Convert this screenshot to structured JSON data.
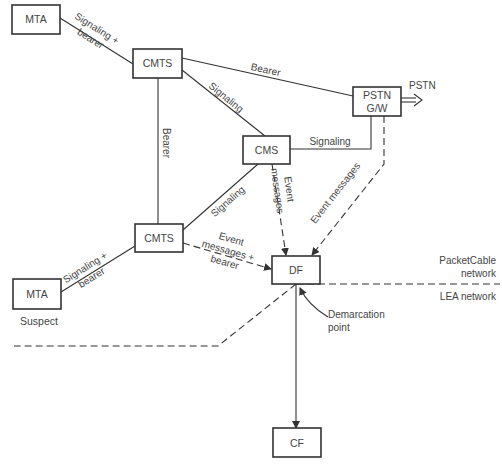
{
  "nodes": {
    "mta_top": {
      "label": "MTA"
    },
    "cmts_top": {
      "label": "CMTS"
    },
    "cms": {
      "label": "CMS"
    },
    "pstn_gw": {
      "label_line1": "PSTN",
      "label_line2": "G/W"
    },
    "cmts_bottom": {
      "label": "CMTS"
    },
    "mta_bottom": {
      "label": "MTA",
      "caption": "Suspect"
    },
    "df": {
      "label": "DF"
    },
    "cf": {
      "label": "CF"
    }
  },
  "edges": {
    "mta_top_cmts": {
      "line1": "Signaling +",
      "line2": "bearer"
    },
    "cmts_pstn": {
      "label": "Bearer"
    },
    "cmts_cms": {
      "label": "Signaling"
    },
    "cmts_cmts": {
      "label": "Bearer"
    },
    "cms_pstn": {
      "label": "Signaling"
    },
    "cms_cmts": {
      "label": "Signaling"
    },
    "cms_df": {
      "line1": "Event",
      "line2": "messages"
    },
    "pstn_df": {
      "label": "Event messages"
    },
    "cmts_df": {
      "line1": "Event",
      "line2": "messages +",
      "line3": "bearer"
    },
    "mta_bottom_cmts": {
      "line1": "Signaling +",
      "line2": "bearer"
    },
    "pstn_out": {
      "label": "PSTN"
    }
  },
  "regions": {
    "packetcable_line1": "PacketCable",
    "packetcable_line2": "network",
    "lea": "LEA network",
    "demarcation_line1": "Demarcation",
    "demarcation_line2": "point"
  },
  "colors": {
    "stroke": "#333333",
    "text": "#444444",
    "background": "#ffffff"
  }
}
